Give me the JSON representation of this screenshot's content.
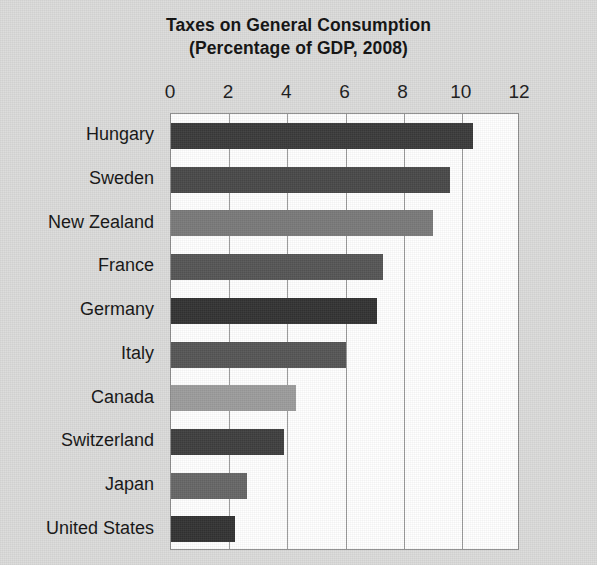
{
  "chart_data": {
    "type": "bar",
    "orientation": "horizontal",
    "title": "Taxes on General Consumption",
    "subtitle": "(Percentage of GDP, 2008)",
    "xlabel": "",
    "ylabel": "",
    "xlim": [
      0,
      12
    ],
    "xticks": [
      0,
      2,
      4,
      6,
      8,
      10,
      12
    ],
    "xtick_labels": [
      "0",
      "2",
      "4",
      "6",
      "8",
      "10",
      "12"
    ],
    "grid": "vertical",
    "legend": "none",
    "categories": [
      "Hungary",
      "Sweden",
      "New Zealand",
      "France",
      "Germany",
      "Italy",
      "Canada",
      "Switzerland",
      "Japan",
      "United States"
    ],
    "values": [
      10.4,
      9.6,
      9.0,
      7.3,
      7.1,
      6.0,
      4.3,
      3.9,
      2.6,
      2.2
    ],
    "bar_colors": [
      "#3b3b3b",
      "#494949",
      "#7a7a7a",
      "#565656",
      "#333333",
      "#565656",
      "#9c9c9c",
      "#3f3f3f",
      "#676767",
      "#333333"
    ]
  },
  "canvas": {
    "background_color": "#dcdcdb",
    "plot_background_color": "#ffffff",
    "gridline_color": "#9b9b9b",
    "axis_border_color": "#8e8e8e",
    "text_color": "#1a1a1a"
  }
}
